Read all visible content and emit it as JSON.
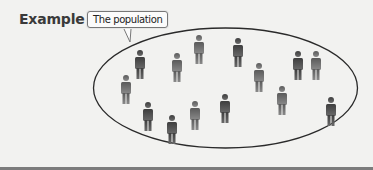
{
  "heading": {
    "title": "Example"
  },
  "callout": {
    "label": "The population"
  },
  "colors": {
    "figure_light": "#9a9a9a",
    "figure_dark": "#4a4a4a",
    "ellipse_stroke": "#2a2a2a",
    "background": "#f2f2f0"
  },
  "diagram": {
    "shape": "ellipse",
    "figure_icon": "person-icon",
    "figure_count": 14
  }
}
